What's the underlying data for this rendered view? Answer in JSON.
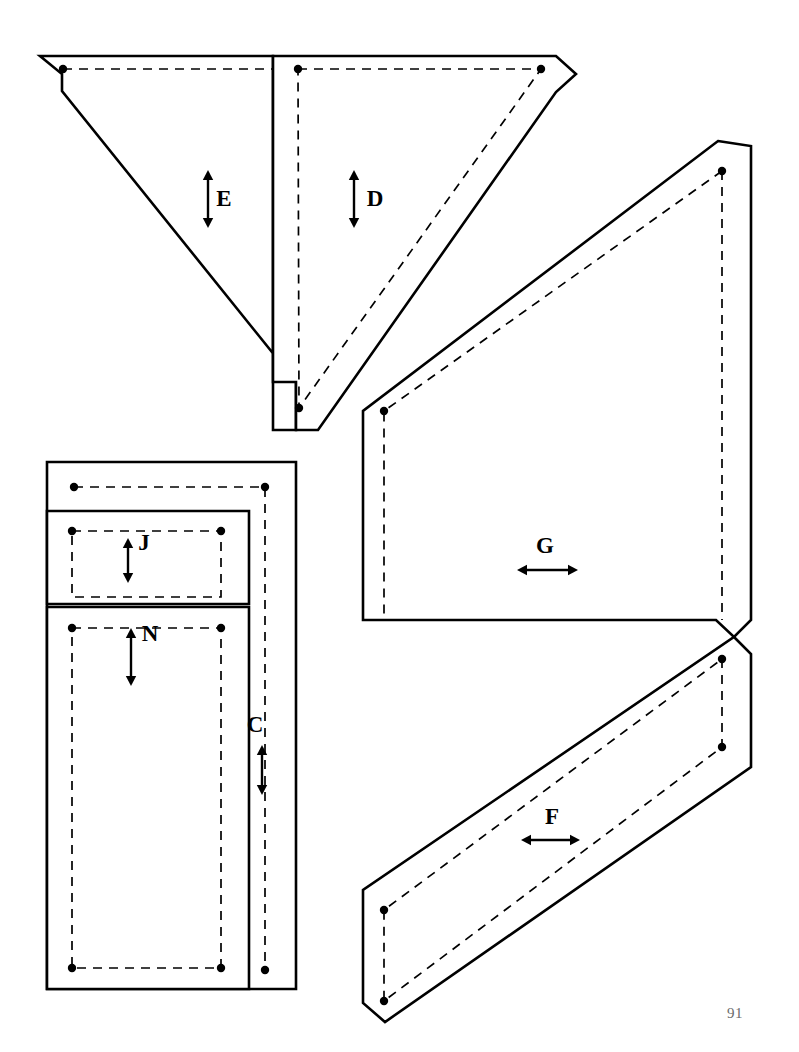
{
  "document": {
    "type": "sewing-pattern-sheet",
    "page_number": "91",
    "background_color": "#ffffff",
    "line_color": "#000000",
    "page_number_color": "#6b6b6b"
  },
  "legend": {
    "cut_line_style": "solid",
    "seam_line_style": "dashed",
    "marker_style": "filled-dot",
    "grain_arrow_style": "double-headed-arrow"
  },
  "pieces": [
    {
      "id": "piece-e",
      "label": "E",
      "label_x": 224,
      "label_y": 206,
      "arrow": {
        "direction": "vertical",
        "x": 208,
        "y1": 170,
        "y2": 228
      },
      "shape": "chamfered-triangle-left-half",
      "cut_path": "M 40 56 L 273 56 L 273 430 L 296 430 L 296 382 L 62 91 L 62 74 Z",
      "seam_path": "M 63 69 L 273 69 L 273 418",
      "dots": [
        {
          "x": 63,
          "y": 69
        }
      ]
    },
    {
      "id": "piece-d",
      "label": "D",
      "label_x": 375,
      "label_y": 206,
      "arrow": {
        "direction": "vertical",
        "x": 354,
        "y1": 170,
        "y2": 228
      },
      "shape": "chamfered-triangle-right-half",
      "cut_path": "M 273 56 L 556 56 L 576 74 L 556 92 L 318 430 L 296 430 L 296 382 L 273 382 Z",
      "seam_path": "M 298 69 L 541 69 L 299 408 Z",
      "dots": [
        {
          "x": 298,
          "y": 69
        },
        {
          "x": 541,
          "y": 69
        },
        {
          "x": 299,
          "y": 408
        }
      ]
    },
    {
      "id": "piece-c",
      "label": "C",
      "label_x": 255,
      "label_y": 732,
      "arrow": {
        "direction": "vertical",
        "x": 262,
        "y1": 745,
        "y2": 795
      },
      "shape": "outer-rectangle-strip",
      "cut_path": "M 47 462 L 296 462 L 296 989 L 47 989 Z",
      "seam_path": "M 74 487 L 265 487 L 265 970",
      "dots": [
        {
          "x": 74,
          "y": 487
        },
        {
          "x": 265,
          "y": 487
        },
        {
          "x": 265,
          "y": 970
        }
      ]
    },
    {
      "id": "piece-j",
      "label": "J",
      "label_x": 144,
      "label_y": 550,
      "arrow": {
        "direction": "vertical",
        "x": 128,
        "y1": 538,
        "y2": 583
      },
      "shape": "short-rectangle",
      "cut_path": "M 47 511 L 249 511 L 249 604 L 47 604 Z",
      "seam_path": "M 72 531 L 221 531 L 221 597 L 72 597 Z",
      "dots": [
        {
          "x": 72,
          "y": 531
        },
        {
          "x": 221,
          "y": 531
        }
      ]
    },
    {
      "id": "piece-n",
      "label": "N",
      "label_x": 150,
      "label_y": 641,
      "arrow": {
        "direction": "vertical",
        "x": 131,
        "y1": 628,
        "y2": 686
      },
      "shape": "tall-rectangle",
      "cut_path": "M 47 607 L 249 607 L 249 989 L 47 989 Z",
      "seam_path": "M 72 628 L 221 628 L 221 968 L 72 968 Z",
      "dots": [
        {
          "x": 72,
          "y": 628
        },
        {
          "x": 221,
          "y": 628
        },
        {
          "x": 221,
          "y": 968
        },
        {
          "x": 72,
          "y": 968
        }
      ]
    },
    {
      "id": "piece-g",
      "label": "G",
      "label_x": 545,
      "label_y": 553,
      "arrow": {
        "direction": "horizontal",
        "y": 570,
        "x1": 517,
        "x2": 578
      },
      "shape": "large-parallelogram",
      "cut_path": "M 718 141 L 751 146 L 751 620 L 734 637 L 716 620 L 363 620 L 363 411 Z",
      "seam_path": "M 722 171 L 722 620 M 722 171 L 384 411 L 384 620",
      "dots": [
        {
          "x": 722,
          "y": 171
        },
        {
          "x": 384,
          "y": 411
        }
      ]
    },
    {
      "id": "piece-f",
      "label": "F",
      "label_x": 552,
      "label_y": 824,
      "arrow": {
        "direction": "horizontal",
        "y": 840,
        "x1": 521,
        "x2": 580
      },
      "shape": "slanted-band",
      "cut_path": "M 734 637 L 751 654 L 751 767 L 385 1022 L 363 1003 L 363 890 Z",
      "seam_path": "M 722 659 L 722 747 L 384 1001 L 384 910 Z",
      "dots": [
        {
          "x": 722,
          "y": 659
        },
        {
          "x": 722,
          "y": 747
        },
        {
          "x": 384,
          "y": 1001
        },
        {
          "x": 384,
          "y": 910
        }
      ]
    }
  ],
  "page_footer": {
    "number": "91",
    "x": 727,
    "y": 1018
  }
}
